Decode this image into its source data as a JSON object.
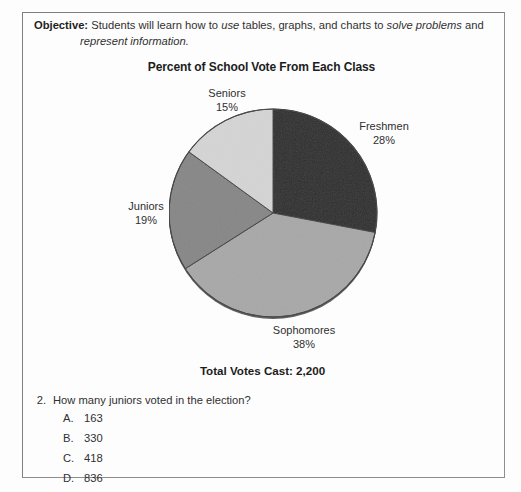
{
  "objective": {
    "label": "Objective:",
    "line1_part1": "Students will learn how to ",
    "line1_italic1": "use",
    "line1_part2": " tables, graphs, and charts to ",
    "line1_italic2": "solve problems",
    "line1_part3": " and",
    "line2_italic": "represent information."
  },
  "chart_data": {
    "type": "pie",
    "title": "Percent of School Vote From Each Class",
    "categories": [
      "Freshmen",
      "Sophomores",
      "Juniors",
      "Seniors"
    ],
    "values": [
      28,
      38,
      19,
      15
    ],
    "value_suffix": "%",
    "colors": [
      "#2d2d2d",
      "#a8a8a8",
      "#878787",
      "#d4d4d4"
    ],
    "start_angle_deg": 0,
    "direction": "clockwise",
    "legend": "none",
    "labels": [
      {
        "name": "Freshmen",
        "pct": "28%"
      },
      {
        "name": "Sophomores",
        "pct": "38%"
      },
      {
        "name": "Juniors",
        "pct": "19%"
      },
      {
        "name": "Seniors",
        "pct": "15%"
      }
    ],
    "footnote": "Total Votes Cast: 2,200"
  },
  "question": {
    "number": "2.",
    "text": "How many juniors voted in the election?",
    "choices": [
      {
        "letter": "A.",
        "text": "163"
      },
      {
        "letter": "B.",
        "text": "330"
      },
      {
        "letter": "C.",
        "text": "418"
      },
      {
        "letter": "D.",
        "text": "836"
      }
    ]
  }
}
